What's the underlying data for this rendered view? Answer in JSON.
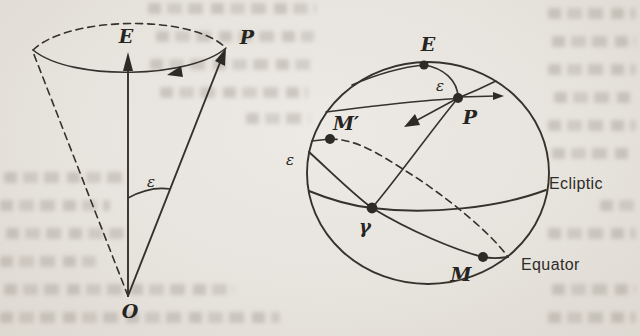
{
  "figure_labels": {
    "cone": {
      "pole_of_ecliptic": "E",
      "celestial_pole": "P",
      "apex": "O",
      "obliquity_angle": "ε"
    },
    "sphere": {
      "pole_of_ecliptic": "E",
      "obliquity_at_pole": "ε",
      "celestial_pole": "P",
      "star_m_prime": "M′",
      "obliquity_at_node": "ε",
      "vernal_equinox": "γ",
      "star_m": "M",
      "ecliptic": "Ecliptic",
      "equator": "Equator"
    }
  },
  "colors": {
    "ink": "#35322c",
    "paper": "#e7e4de"
  }
}
